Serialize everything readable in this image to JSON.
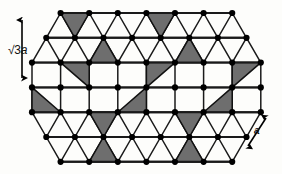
{
  "figure": {
    "name": "triangular-lattice-superlattice-diagram",
    "background_color": "#fdfdfb"
  },
  "labels": {
    "vertical": {
      "id": "sqrt3a",
      "prefix": "√3",
      "italic_part": "a",
      "full_text": "√3a",
      "arrow": "double-headed-vertical-arrow"
    },
    "diagonal": {
      "id": "a",
      "full_text": "a",
      "arrow": "double-headed-diagonal-arrow"
    }
  },
  "style": {
    "node_color": "#000000",
    "node_radius": 3.1,
    "bond_color": "#1a1a1a",
    "bond_width": 1.5,
    "shaded_triangle_fill": "#6e6e6e",
    "shaded_triangle_stroke": "#111111",
    "unshaded_triangle_fill": "none",
    "arrow_color": "#000000",
    "label_color": "#111111"
  },
  "lattice": {
    "type": "triangular",
    "spacing_x": 28.6,
    "spacing_y": 24.8,
    "origin_x": 32.0,
    "origin_y": 13.0,
    "rows": 7,
    "row_node_counts": [
      7,
      8,
      9,
      9,
      9,
      8,
      7
    ],
    "row_offsets": [
      2,
      1,
      0,
      0,
      0,
      1,
      2
    ],
    "shape": "hexagonal-patch",
    "row_y": [
      13.0,
      37.8,
      62.6,
      87.4,
      112.2,
      137.0,
      161.8
    ]
  },
  "chart_data": {
    "type": "scatter",
    "title": "",
    "xlabel": "",
    "ylabel": "",
    "legend": [],
    "grid": false,
    "superlattice": {
      "notation": "√3 × √3",
      "primitive_vector_a": "a",
      "superlattice_vector": "√3a",
      "shaded_fraction": "1/3"
    },
    "shaded_triangles": [
      {
        "row": 0,
        "col": 0,
        "orientation": "down"
      },
      {
        "row": 0,
        "col": 3,
        "orientation": "down"
      },
      {
        "row": 0,
        "col": 6,
        "orientation": "down"
      },
      {
        "row": 1,
        "col": 2,
        "orientation": "up"
      },
      {
        "row": 1,
        "col": 5,
        "orientation": "up"
      },
      {
        "row": 2,
        "col": 1,
        "orientation": "down"
      },
      {
        "row": 2,
        "col": 4,
        "orientation": "down"
      },
      {
        "row": 2,
        "col": 7,
        "orientation": "down"
      },
      {
        "row": 3,
        "col": 0,
        "orientation": "up"
      },
      {
        "row": 3,
        "col": 3,
        "orientation": "up"
      },
      {
        "row": 3,
        "col": 6,
        "orientation": "up"
      },
      {
        "row": 4,
        "col": 2,
        "orientation": "down"
      },
      {
        "row": 4,
        "col": 5,
        "orientation": "down"
      },
      {
        "row": 5,
        "col": 1,
        "orientation": "up"
      },
      {
        "row": 5,
        "col": 4,
        "orientation": "up"
      }
    ]
  }
}
